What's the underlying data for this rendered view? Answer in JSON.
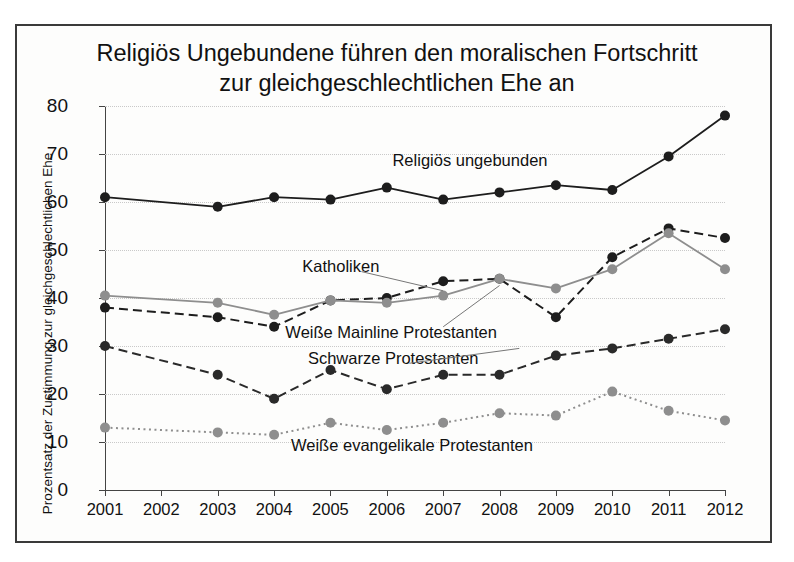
{
  "figure": {
    "title": "Religiös Ungebundene führen den moralischen Fortschritt zur gleichgeschlechtlichen Ehe an",
    "ylabel": "Prozentsatz der Zustimmung zur gleichgeschlechtlichen Ehe",
    "border_color": "#3a3a3a",
    "background": "#fdfdfc"
  },
  "chart_data": {
    "type": "line",
    "title": "Religiös Ungebundene führen den moralischen Fortschritt zur gleichgeschlechtlichen Ehe an",
    "xlabel": "",
    "ylabel": "Prozentsatz der Zustimmung zur gleichgeschlechtlichen Ehe",
    "categories": [
      "2001",
      "2002",
      "2003",
      "2004",
      "2005",
      "2006",
      "2007",
      "2008",
      "2009",
      "2010",
      "2011",
      "2012"
    ],
    "x": [
      2001,
      2002,
      2003,
      2004,
      2005,
      2006,
      2007,
      2008,
      2009,
      2010,
      2011,
      2012
    ],
    "ylim": [
      0,
      80
    ],
    "yticks": [
      0,
      10,
      20,
      30,
      40,
      50,
      60,
      70,
      80
    ],
    "xlim": [
      2001,
      2012
    ],
    "grid": true,
    "legend_position": "inline-annotations",
    "note": "Kein Datenpunkt für 2002; Linien verbinden 2001 direkt mit 2003.",
    "series": [
      {
        "name": "Religiös ungebunden",
        "color": "#1d1d1d",
        "style": "solid",
        "marker": "circle",
        "values": [
          61,
          null,
          59,
          61,
          60.5,
          63,
          60.5,
          62,
          63.5,
          62.5,
          69.5,
          78
        ]
      },
      {
        "name": "Katholiken",
        "color": "#1d1d1d",
        "style": "dashed",
        "marker": "circle",
        "values": [
          38,
          null,
          36,
          34,
          39.5,
          40,
          43.5,
          44,
          36,
          48.5,
          54.5,
          52.5
        ]
      },
      {
        "name": "Weiße Mainline Protestanten",
        "color": "#8e8e8e",
        "style": "solid",
        "marker": "circle",
        "values": [
          40.5,
          null,
          39,
          36.5,
          39.5,
          39,
          40.5,
          44,
          42,
          46,
          53.5,
          46
        ]
      },
      {
        "name": "Schwarze Protestanten",
        "color": "#2a2a2a",
        "style": "dashed",
        "marker": "circle",
        "values": [
          30,
          null,
          24,
          19,
          25,
          21,
          24,
          24,
          28,
          29.5,
          31.5,
          33.5
        ]
      },
      {
        "name": "Weiße evangelikale Protestanten",
        "color": "#8e8e8e",
        "style": "dotted",
        "marker": "circle",
        "values": [
          13,
          null,
          12,
          11.5,
          14,
          12.5,
          14,
          16,
          15.5,
          20.5,
          16.5,
          14.5
        ]
      }
    ],
    "annotations": [
      {
        "text": "Religiös ungebunden",
        "x": 2006.1,
        "y": 68.5
      },
      {
        "text": "Katholiken",
        "x": 2004.5,
        "y": 46.5
      },
      {
        "text": "Weiße Mainline Protestanten",
        "x": 2004.2,
        "y": 32.8
      },
      {
        "text": "Schwarze Protestanten",
        "x": 2004.6,
        "y": 27.2
      },
      {
        "text": "Weiße evangelikale Protestanten",
        "x": 2004.3,
        "y": 9.2
      }
    ]
  }
}
